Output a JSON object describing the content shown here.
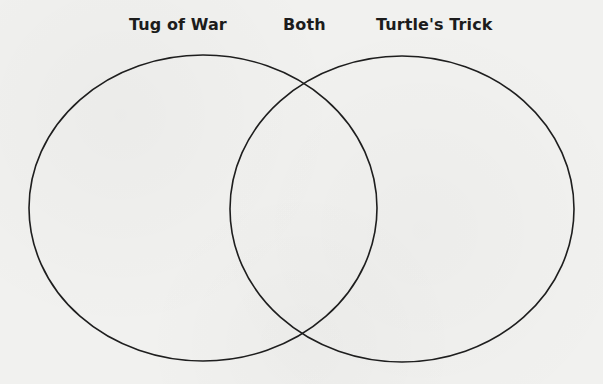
{
  "diagram": {
    "type": "venn",
    "labels": {
      "left": "Tug of War",
      "middle": "Both",
      "right": "Turtle's Trick"
    },
    "circles": [
      {
        "name": "Tug of War",
        "cx": 203,
        "cy": 208,
        "rx": 174,
        "ry": 153
      },
      {
        "name": "Turtle's Trick",
        "cx": 402,
        "cy": 209,
        "rx": 172,
        "ry": 153
      }
    ],
    "stroke_color": "#1e1e1e",
    "background_color": "#f1f1ef"
  }
}
